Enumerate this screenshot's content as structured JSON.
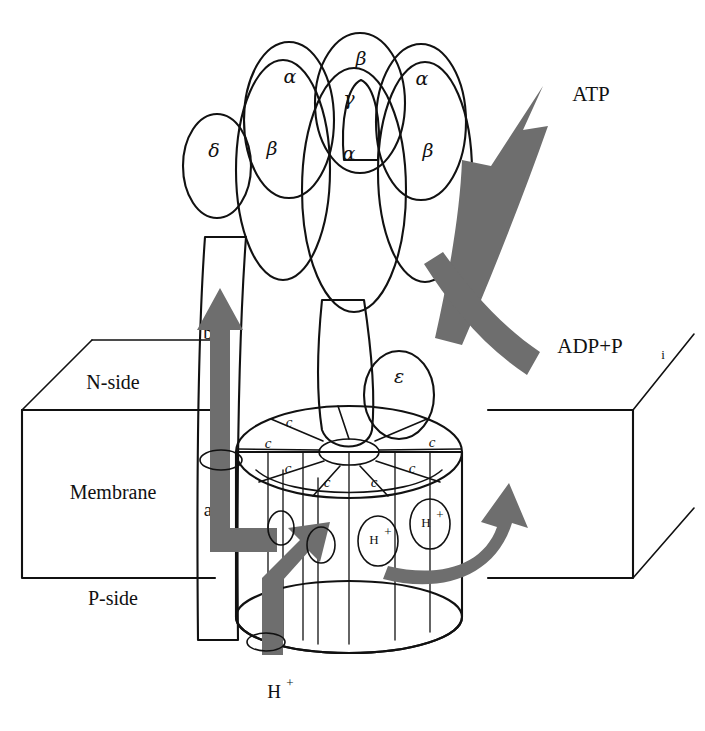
{
  "figure": {
    "background_color": "#ffffff",
    "line_color": "#111111"
  },
  "palette": {
    "white_subunit": "#ffffff",
    "gray_subunit": "#c9c9c9",
    "dark_subunit": "#8a8a8a",
    "arrow_gray": "#6e6e6e",
    "proton_circle": "#c9c9c9"
  },
  "f1_head": {
    "back_row": [
      {
        "id": "alpha-back-left",
        "label": "α",
        "shade": "white"
      },
      {
        "id": "beta-back-center",
        "label": "β",
        "shade": "gray"
      },
      {
        "id": "alpha-back-right",
        "label": "α",
        "shade": "white"
      }
    ],
    "front_row": [
      {
        "id": "beta-front-left",
        "label": "β",
        "shade": "gray"
      },
      {
        "id": "alpha-front-center",
        "label": "α",
        "shade": "white"
      },
      {
        "id": "beta-front-right",
        "label": "β",
        "shade": "gray"
      }
    ],
    "gamma": {
      "id": "gamma-subunit",
      "label": "γ",
      "shade": "dark"
    },
    "delta": {
      "id": "delta-subunit",
      "label": "δ",
      "shade": "white"
    }
  },
  "fo_motor": {
    "epsilon": {
      "id": "epsilon-subunit",
      "label": "ε",
      "shade": "white"
    },
    "c_ring_label": "c",
    "c_ring_segments": [
      "c",
      "c",
      "c",
      "c",
      "c",
      "c",
      "c"
    ],
    "stalk_b": {
      "id": "b-subunit",
      "label": "b"
    },
    "stalk_a": {
      "id": "a-subunit",
      "label": "a"
    }
  },
  "membrane": {
    "n_side": "N-side",
    "body": "Membrane",
    "p_side": "P-side"
  },
  "molecules": {
    "atp": "ATP",
    "adp": "ADP+P",
    "adp_subscript": "i",
    "proton": "H",
    "proton_charge": "+"
  },
  "protons_in_channel": [
    {
      "id": "proton-1",
      "label": "H",
      "charge": "+"
    },
    {
      "id": "proton-2",
      "label": "H",
      "charge": "+"
    }
  ],
  "arrows": {
    "atp_out": "ATP output arrow",
    "adp_in": "ADP and phosphate input arrow",
    "rotation": "c-ring rotation arrow",
    "proton_path_up": "proton translocation arrow through a subunit",
    "proton_entry": "proton entry arrow from P-side"
  }
}
